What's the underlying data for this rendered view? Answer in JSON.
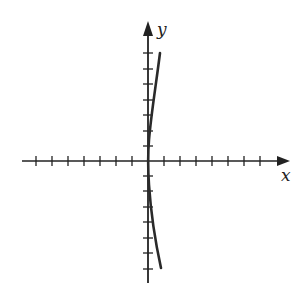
{
  "figure": {
    "type": "coordinate-plane-curve",
    "x_axis_label": "x",
    "y_axis_label": "y",
    "x_ticks_left": 7,
    "x_ticks_right": 7,
    "y_ticks_above": 7,
    "y_ticks_below": 7,
    "curve_description": "curve opening to the right, symmetric about x-axis, nearly tangent to y-axis near origin",
    "colors": {
      "axis": "#222222",
      "curve": "#2a2a2a",
      "background": "#ffffff"
    }
  }
}
